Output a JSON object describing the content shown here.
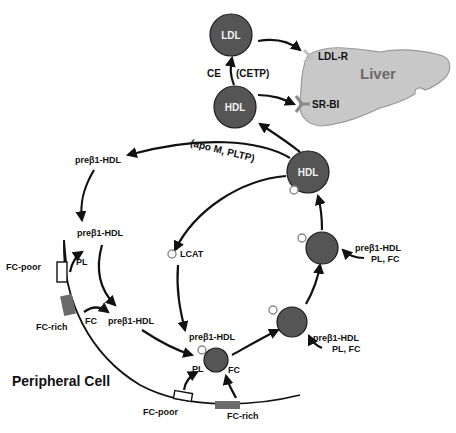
{
  "diagram": {
    "liver": {
      "label": "Liver",
      "fill": "#c8c8c8"
    },
    "receptors": {
      "ldl_r": "LDL-R",
      "sr_bi": "SR-BI"
    },
    "particles": {
      "ldl": "LDL",
      "hdl_upper": "HDL",
      "hdl_mature": "HDL"
    },
    "labels": {
      "ce": "CE",
      "cetp": "(CETP)",
      "apo_m_pltp": "(apo M, PLTP)",
      "prebeta_top": "preβ1-HDL",
      "prebeta_left": "preβ1-HDL",
      "prebeta_mid": "preβ1-HDL",
      "prebeta_bottom": "preβ1-HDL",
      "prebeta_right_upper": "preβ1-HDL",
      "prebeta_right_upper_sub": "PL, FC",
      "prebeta_right_lower": "preβ1-HDL",
      "prebeta_right_lower_sub": "PL, FC",
      "lcat": "LCAT",
      "pl_left": "PL",
      "fc_left": "FC",
      "pl_bottom": "PL",
      "fc_bottom": "FC",
      "fc_poor_left": "FC-poor",
      "fc_rich_left": "FC-rich",
      "fc_poor_bottom": "FC-poor",
      "fc_rich_bottom": "FC-rich",
      "peripheral_cell": "Peripheral Cell"
    },
    "colors": {
      "particle": "#555555",
      "fc_rich_domain": "#6b6b6b",
      "receptor_ldl_r": "#c0c0c0",
      "receptor_sr_bi": "#8a8a8a"
    }
  }
}
